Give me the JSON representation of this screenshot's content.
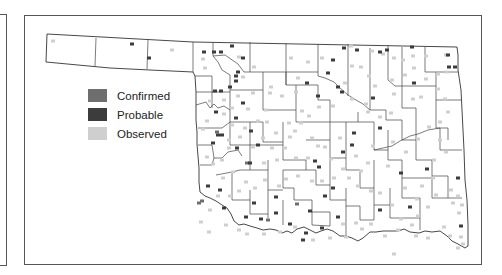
{
  "legend": {
    "items": [
      {
        "label": "Confirmed",
        "color": "#6e6e6e"
      },
      {
        "label": "Probable",
        "color": "#3c3c3c"
      },
      {
        "label": "Observed",
        "color": "#cfcfcf"
      }
    ]
  },
  "map": {
    "region": "Oklahoma counties",
    "outline_color": "#333333",
    "county_line_color": "#555555"
  },
  "points": {
    "probable": [
      [
        132,
        44
      ],
      [
        149,
        58
      ],
      [
        204,
        52
      ],
      [
        214,
        52
      ],
      [
        221,
        52
      ],
      [
        232,
        46
      ],
      [
        243,
        58
      ],
      [
        238,
        72
      ],
      [
        236,
        81
      ],
      [
        215,
        91
      ],
      [
        221,
        91
      ],
      [
        230,
        87
      ],
      [
        243,
        103
      ],
      [
        216,
        112
      ],
      [
        218,
        135
      ],
      [
        213,
        143
      ],
      [
        236,
        118
      ],
      [
        251,
        131
      ],
      [
        258,
        145
      ],
      [
        250,
        163
      ],
      [
        222,
        135
      ],
      [
        236,
        76
      ],
      [
        344,
        48
      ],
      [
        357,
        50
      ],
      [
        380,
        52
      ],
      [
        307,
        83
      ],
      [
        333,
        60
      ],
      [
        328,
        73
      ],
      [
        318,
        96
      ],
      [
        338,
        87
      ],
      [
        342,
        92
      ],
      [
        373,
        98
      ],
      [
        387,
        50
      ],
      [
        412,
        47
      ],
      [
        448,
        55
      ],
      [
        449,
        67
      ],
      [
        455,
        67
      ],
      [
        414,
        83
      ],
      [
        380,
        128
      ],
      [
        354,
        133
      ],
      [
        343,
        152
      ],
      [
        319,
        167
      ],
      [
        315,
        161
      ],
      [
        352,
        145
      ],
      [
        401,
        173
      ],
      [
        427,
        169
      ],
      [
        458,
        178
      ],
      [
        333,
        188
      ],
      [
        310,
        211
      ],
      [
        338,
        217
      ],
      [
        380,
        210
      ],
      [
        410,
        207
      ],
      [
        461,
        226
      ],
      [
        303,
        240
      ],
      [
        325,
        196
      ],
      [
        254,
        203
      ],
      [
        276,
        197
      ],
      [
        237,
        148
      ],
      [
        220,
        190
      ],
      [
        208,
        186
      ],
      [
        224,
        208
      ],
      [
        246,
        217
      ],
      [
        261,
        219
      ],
      [
        276,
        213
      ],
      [
        290,
        224
      ],
      [
        306,
        233
      ],
      [
        322,
        228
      ]
    ],
    "confirmed": [
      [
        199,
        203
      ],
      [
        202,
        201
      ],
      [
        217,
        132
      ],
      [
        247,
        163
      ],
      [
        297,
        204
      ],
      [
        268,
        220
      ]
    ],
    "observed": [
      [
        53,
        41
      ],
      [
        172,
        50
      ],
      [
        203,
        59
      ],
      [
        205,
        68
      ],
      [
        239,
        57
      ],
      [
        254,
        67
      ],
      [
        243,
        77
      ],
      [
        271,
        87
      ],
      [
        291,
        58
      ],
      [
        308,
        62
      ],
      [
        322,
        58
      ],
      [
        351,
        46
      ],
      [
        372,
        51
      ],
      [
        383,
        54
      ],
      [
        394,
        58
      ],
      [
        403,
        60
      ],
      [
        413,
        56
      ],
      [
        426,
        56
      ],
      [
        446,
        55
      ],
      [
        447,
        72
      ],
      [
        438,
        74
      ],
      [
        438,
        89
      ],
      [
        445,
        99
      ],
      [
        448,
        112
      ],
      [
        440,
        122
      ],
      [
        421,
        97
      ],
      [
        413,
        99
      ],
      [
        394,
        94
      ],
      [
        391,
        113
      ],
      [
        380,
        117
      ],
      [
        366,
        104
      ],
      [
        368,
        112
      ],
      [
        345,
        83
      ],
      [
        352,
        99
      ],
      [
        333,
        106
      ],
      [
        319,
        107
      ],
      [
        309,
        116
      ],
      [
        301,
        123
      ],
      [
        295,
        131
      ],
      [
        285,
        148
      ],
      [
        277,
        160
      ],
      [
        264,
        163
      ],
      [
        253,
        147
      ],
      [
        240,
        137
      ],
      [
        229,
        148
      ],
      [
        222,
        160
      ],
      [
        233,
        172
      ],
      [
        223,
        178
      ],
      [
        213,
        164
      ],
      [
        207,
        157
      ],
      [
        207,
        121
      ],
      [
        203,
        129
      ],
      [
        210,
        101
      ],
      [
        224,
        100
      ],
      [
        232,
        108
      ],
      [
        248,
        109
      ],
      [
        266,
        110
      ],
      [
        267,
        122
      ],
      [
        258,
        121
      ],
      [
        276,
        133
      ],
      [
        289,
        123
      ],
      [
        302,
        111
      ],
      [
        312,
        138
      ],
      [
        325,
        147
      ],
      [
        340,
        138
      ],
      [
        331,
        159
      ],
      [
        343,
        169
      ],
      [
        361,
        171
      ],
      [
        368,
        163
      ],
      [
        373,
        146
      ],
      [
        393,
        142
      ],
      [
        406,
        152
      ],
      [
        418,
        139
      ],
      [
        429,
        127
      ],
      [
        440,
        140
      ],
      [
        446,
        152
      ],
      [
        434,
        160
      ],
      [
        433,
        178
      ],
      [
        422,
        186
      ],
      [
        436,
        195
      ],
      [
        451,
        190
      ],
      [
        458,
        196
      ],
      [
        462,
        205
      ],
      [
        459,
        213
      ],
      [
        453,
        203
      ],
      [
        428,
        207
      ],
      [
        418,
        216
      ],
      [
        412,
        225
      ],
      [
        401,
        219
      ],
      [
        392,
        205
      ],
      [
        380,
        193
      ],
      [
        371,
        191
      ],
      [
        358,
        186
      ],
      [
        349,
        178
      ],
      [
        334,
        178
      ],
      [
        322,
        181
      ],
      [
        312,
        181
      ],
      [
        298,
        176
      ],
      [
        286,
        179
      ],
      [
        279,
        186
      ],
      [
        265,
        180
      ],
      [
        255,
        188
      ],
      [
        246,
        182
      ],
      [
        239,
        191
      ],
      [
        230,
        196
      ],
      [
        218,
        196
      ],
      [
        210,
        210
      ],
      [
        201,
        222
      ],
      [
        209,
        232
      ],
      [
        226,
        225
      ],
      [
        239,
        230
      ],
      [
        247,
        234
      ],
      [
        264,
        234
      ],
      [
        280,
        232
      ],
      [
        295,
        227
      ],
      [
        313,
        240
      ],
      [
        330,
        238
      ],
      [
        346,
        237
      ],
      [
        362,
        229
      ],
      [
        371,
        224
      ],
      [
        385,
        236
      ],
      [
        398,
        230
      ],
      [
        416,
        236
      ],
      [
        428,
        238
      ],
      [
        444,
        227
      ],
      [
        450,
        236
      ],
      [
        461,
        237
      ],
      [
        463,
        244
      ],
      [
        458,
        248
      ],
      [
        253,
        93
      ],
      [
        270,
        93
      ],
      [
        282,
        96
      ],
      [
        296,
        92
      ],
      [
        298,
        78
      ],
      [
        352,
        66
      ],
      [
        361,
        67
      ],
      [
        369,
        76
      ],
      [
        375,
        86
      ],
      [
        392,
        80
      ],
      [
        405,
        75
      ],
      [
        414,
        68
      ],
      [
        426,
        79
      ],
      [
        238,
        96
      ],
      [
        232,
        125
      ],
      [
        245,
        128
      ],
      [
        224,
        114
      ],
      [
        229,
        140
      ],
      [
        290,
        137
      ],
      [
        296,
        158
      ],
      [
        308,
        158
      ],
      [
        318,
        146
      ],
      [
        263,
        138
      ],
      [
        272,
        148
      ],
      [
        356,
        156
      ],
      [
        388,
        166
      ],
      [
        405,
        188
      ],
      [
        417,
        199
      ],
      [
        394,
        254
      ],
      [
        356,
        223
      ],
      [
        343,
        224
      ]
    ]
  }
}
